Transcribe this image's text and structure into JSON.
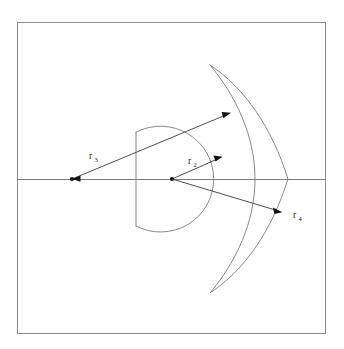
{
  "figure": {
    "background_color": "#ffffff",
    "frame": {
      "name": "outer-border",
      "x": 17,
      "y": 22,
      "width": 309,
      "height": 312,
      "stroke_color": "#8a8a8a"
    },
    "axis": {
      "name": "optical-axis",
      "y": 179,
      "x_start": 17,
      "x_end": 326,
      "stroke_color": "#7d7d7d"
    },
    "vertices": [
      {
        "name": "left-center-of-curvature",
        "x": 72,
        "y": 179,
        "label": "r3-origin"
      },
      {
        "name": "right-center-of-curvature",
        "x": 172,
        "y": 179,
        "label": "r2-r4-origin"
      }
    ],
    "shapes": [
      {
        "name": "flat-backed-circle-element",
        "type": "circle-with-flat-chord",
        "center_x": 172,
        "center_y": 179,
        "radius": 53,
        "chord_x": 136,
        "stroke_color": "#7a7a7a"
      },
      {
        "name": "meniscus-crescent-element",
        "type": "crescent",
        "tip_top_x": 210,
        "tip_top_y": 65,
        "tip_bottom_x": 210,
        "tip_bottom_y": 293,
        "outer_axis_x": 288,
        "inner_axis_x": 270,
        "stroke_color": "#7a7a7a"
      }
    ],
    "radii": [
      {
        "name": "radius-r3",
        "base": "r",
        "subscript": "3",
        "from_x": 72,
        "from_y": 179,
        "to_x": 230,
        "to_y": 113,
        "label_x": 89,
        "label_y": 159,
        "color": "#3a3a3a"
      },
      {
        "name": "radius-r2",
        "base": "r",
        "subscript": "2",
        "from_x": 172,
        "from_y": 179,
        "to_x": 222,
        "to_y": 157,
        "label_x": 188,
        "label_y": 164,
        "color": "#3a3a3a"
      },
      {
        "name": "radius-r4",
        "base": "r",
        "subscript": "4",
        "from_x": 172,
        "from_y": 179,
        "to_x": 282,
        "to_y": 212,
        "label_x": 293,
        "label_y": 218,
        "color": "#3a3a3a"
      }
    ]
  }
}
